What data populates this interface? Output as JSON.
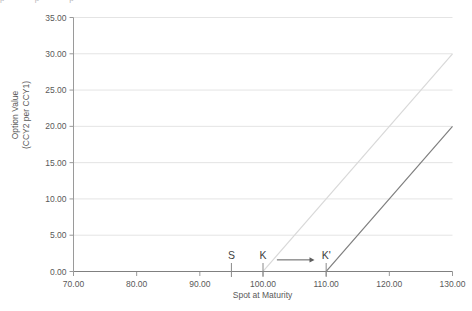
{
  "chart_data": {
    "type": "line",
    "title": "",
    "xlabel": "Spot at Maturity",
    "ylabel_line1": "Option Value",
    "ylabel_line2": "(CCY2 per CCY1)",
    "xlim": [
      70,
      130
    ],
    "ylim": [
      0,
      35
    ],
    "grid": true,
    "legend": "none",
    "x_ticks": [
      "70.00",
      "80.00",
      "90.00",
      "100.00",
      "110.00",
      "120.00",
      "130.00"
    ],
    "x_tick_values": [
      70,
      80,
      90,
      100,
      110,
      120,
      130
    ],
    "y_ticks": [
      "0.00",
      "5.00",
      "10.00",
      "15.00",
      "20.00",
      "25.00",
      "30.00",
      "35.00"
    ],
    "y_tick_values": [
      0,
      5,
      10,
      15,
      20,
      25,
      30,
      35
    ],
    "series": [
      {
        "name": "original-call-payoff",
        "color": "#d9d9d9",
        "strike": 100,
        "x": [
          70,
          100,
          130
        ],
        "values": [
          0,
          0,
          30
        ]
      },
      {
        "name": "shifted-call-payoff",
        "color": "#808080",
        "strike": 110,
        "x": [
          70,
          110,
          130
        ],
        "values": [
          0,
          0,
          20
        ]
      }
    ],
    "annotations": [
      {
        "name": "spot-marker",
        "label": "S",
        "x": 95,
        "y": 0
      },
      {
        "name": "strike-marker",
        "label": "K",
        "x": 100,
        "y": 0
      },
      {
        "name": "shifted-strike-marker",
        "label": "K'",
        "x": 110,
        "y": 0
      },
      {
        "name": "shift-arrow",
        "label": "",
        "x_from": 102.2,
        "x_to": 107.6,
        "y": 1.6
      }
    ]
  },
  "top_artifact": {
    "text": "p   p   p"
  },
  "colors": {
    "background": "#ffffff",
    "gridline": "#e4e4e4",
    "axis": "#9a9a9a",
    "baseline": "#808080",
    "text": "#595959",
    "series_light": "#d9d9d9",
    "series_dark": "#808080"
  }
}
